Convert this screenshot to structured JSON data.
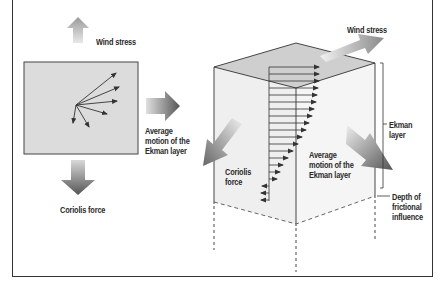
{
  "diagram": {
    "left_panel": {
      "wind_stress_label": "Wind stress",
      "coriolis_label": "Coriolis force",
      "average_motion_label_lines": [
        "Average",
        "motion of the",
        "Ekman layer"
      ]
    },
    "right_panel": {
      "wind_stress_label": "Wind stress",
      "coriolis_label_lines": [
        "Coriolis",
        "force"
      ],
      "average_motion_label_lines": [
        "Average",
        "motion of the",
        "Ekman layer"
      ],
      "ekman_layer_label_lines": [
        "Ekman",
        "layer"
      ],
      "depth_label_lines": [
        "Depth of",
        "frictional",
        "influence"
      ]
    },
    "colors": {
      "panel_fill": "#dcdcdc",
      "arrow_dark": "#555555",
      "arrow_light": "#bdbdbd",
      "line": "#333333"
    }
  }
}
